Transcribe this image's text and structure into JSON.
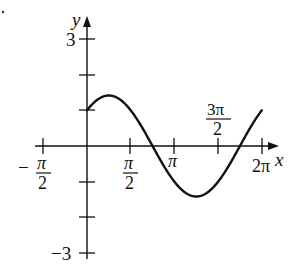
{
  "chart_data": {
    "type": "line",
    "title": "",
    "xlabel": "x",
    "ylabel": "y",
    "function": "y = sin x + cos x",
    "xlim": [
      -1.5708,
      6.2832
    ],
    "ylim": [
      -3,
      3
    ],
    "grid": false,
    "x_ticks": [
      {
        "value": -1.5708,
        "num": "π",
        "den": "2",
        "sign": "−"
      },
      {
        "value": 1.5708,
        "num": "π",
        "den": "2",
        "sign": ""
      },
      {
        "value": 3.1416,
        "label": "π"
      },
      {
        "value": 4.7124,
        "num": "3π",
        "den": "2",
        "sign": ""
      },
      {
        "value": 6.2832,
        "label": "2π"
      }
    ],
    "y_ticks": [
      {
        "value": 3,
        "label": "3"
      },
      {
        "value": 2,
        "label": ""
      },
      {
        "value": 1,
        "label": ""
      },
      {
        "value": -1,
        "label": ""
      },
      {
        "value": -2,
        "label": ""
      },
      {
        "value": -3,
        "label": "−3"
      }
    ],
    "series": [
      {
        "name": "curve",
        "x": [
          0,
          0.7854,
          1.5708,
          2.3562,
          3.1416,
          3.927,
          4.7124,
          5.4978,
          6.2832
        ],
        "values": [
          1,
          1.414,
          1,
          0,
          -1,
          -1.414,
          -1,
          0,
          1
        ]
      }
    ],
    "annotations": []
  },
  "labels": {
    "x_axis": "x",
    "y_axis": "y",
    "y_top": "3",
    "y_bottom": "−3",
    "neg_half_pi_sign": "−",
    "pi": "π",
    "two": "2",
    "three_pi": "3π",
    "two_pi": "2π"
  }
}
